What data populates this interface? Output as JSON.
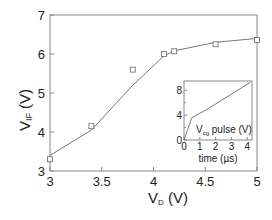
{
  "chart_data": [
    {
      "type": "scatter",
      "title": "",
      "xlabel": "V_D (V)",
      "ylabel": "V_IF (V)",
      "xlim": [
        3,
        5
      ],
      "ylim": [
        3,
        7
      ],
      "x_ticks": [
        3,
        3.5,
        4,
        4.5,
        5
      ],
      "x_tick_labels": [
        "3",
        "3.5",
        "4",
        "4.5",
        "5"
      ],
      "y_ticks": [
        3,
        4,
        5,
        6,
        7
      ],
      "y_tick_labels": [
        "3",
        "4",
        "5",
        "6",
        "7"
      ],
      "grid": false,
      "legend": null,
      "series": [
        {
          "name": "measured",
          "marker": "open-square",
          "x": [
            3.0,
            3.4,
            3.8,
            4.1,
            4.2,
            4.6,
            5.0
          ],
          "y": [
            3.3,
            4.15,
            5.6,
            6.0,
            6.07,
            6.25,
            6.36
          ]
        },
        {
          "name": "fit",
          "style": "line",
          "x": [
            3.0,
            3.4,
            3.8,
            4.1,
            4.2,
            4.6,
            5.0
          ],
          "y": [
            3.4,
            4.05,
            5.2,
            5.95,
            6.08,
            6.3,
            6.4
          ]
        }
      ]
    },
    {
      "type": "line",
      "title": "V_cg pulse (V)",
      "xlabel": "time (µs)",
      "ylabel": "",
      "xlim": [
        0,
        4.3
      ],
      "ylim": [
        0,
        9.5
      ],
      "x_ticks": [
        0,
        1,
        2,
        3,
        4
      ],
      "x_tick_labels": [
        "0",
        "1",
        "2",
        "3",
        "4"
      ],
      "y_ticks": [
        0,
        4,
        8
      ],
      "y_tick_labels": [
        "0",
        "4",
        "8"
      ],
      "grid": false,
      "series": [
        {
          "name": "V_cg pulse",
          "x": [
            0,
            0.5,
            1.5,
            4.2
          ],
          "y": [
            0,
            3.6,
            5.0,
            9.3
          ]
        }
      ]
    }
  ],
  "labels": {
    "main_x_main": "V",
    "main_x_sub": "D",
    "main_x_unit": " (V)",
    "main_y_main": "V",
    "main_y_sub": "IF",
    "main_y_unit": " (V)",
    "inset_title_main": "V",
    "inset_title_sub": "cg",
    "inset_title_rest": " pulse (V)",
    "inset_x": "time (µs)"
  },
  "colors": {
    "axis": "#888888",
    "line": "#777777",
    "marker": "#666666",
    "text": "#222222"
  }
}
